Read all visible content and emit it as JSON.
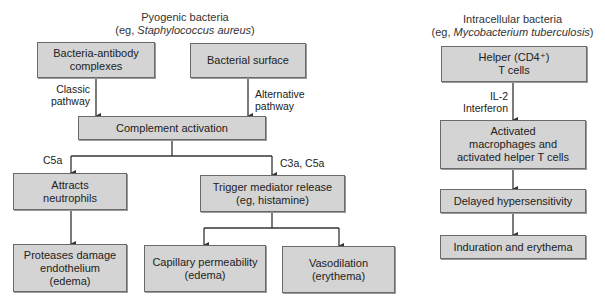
{
  "left_diagram": {
    "heading": {
      "line1": "Pyogenic bacteria",
      "line2_prefix": "(eg, ",
      "line2_italic": "Staphylococcus aureus",
      "line2_suffix": ")"
    },
    "boxes": {
      "bacteria_antibody": "Bacteria-antibody complexes",
      "bacterial_surface": "Bacterial surface",
      "complement_activation": "Complement activation",
      "attracts_neutrophils": "Attracts neutrophils",
      "trigger_mediator": "Trigger mediator release (eg, histamine)",
      "proteases_damage": "Proteases damage endothelium (edema)",
      "capillary_permeability": "Capillary permeability (edema)",
      "vasodilation": "Vasodilation (erythema)"
    },
    "edge_labels": {
      "classic_line1": "Classic",
      "classic_line2": "pathway",
      "alternative_line1": "Alternative",
      "alternative_line2": "pathway",
      "c5a": "C5a",
      "c3a_c5a": "C3a, C5a"
    }
  },
  "right_diagram": {
    "heading": {
      "line1": "Intracellular bacteria",
      "line2_prefix": "(eg, ",
      "line2_italic": "Mycobacterium tuberculosis",
      "line2_suffix": ")"
    },
    "boxes": {
      "helper_t_line1": "Helper (CD4⁺)",
      "helper_t_line2": "T cells",
      "activated_line1": "Activated",
      "activated_line2": "macrophages and",
      "activated_line3": "activated helper T cells",
      "delayed_hypersensitivity": "Delayed hypersensitivity",
      "induration": "Induration and erythema"
    },
    "edge_labels": {
      "il2": "IL-2",
      "interferon": "Interferon"
    }
  },
  "colors": {
    "box_fill": "#d4d4d4",
    "box_border": "#6a6a6a",
    "line": "#333333"
  }
}
